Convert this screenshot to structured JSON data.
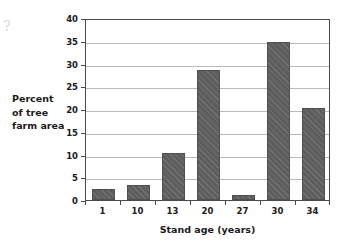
{
  "chart_data": {
    "type": "bar",
    "title": "",
    "categories": [
      "1",
      "10",
      "13",
      "20",
      "27",
      "30",
      "34"
    ],
    "values": [
      2.5,
      3.2,
      10.3,
      28.5,
      1.2,
      34.7,
      20.3
    ],
    "xlabel": "Stand age (years)",
    "ylabel": "Percent of tree farm area",
    "ylabel_lines": [
      "Percent",
      "of tree",
      "farm area"
    ],
    "ylim": [
      0,
      40
    ],
    "ytick_step": 5,
    "yticks": [
      "0",
      "5",
      "10",
      "15",
      "20",
      "25",
      "30",
      "35",
      "40"
    ],
    "grid": "horizontal",
    "legend": "none",
    "bar_color": "#5d5d5d",
    "bar_pattern": "diagonal-hatch",
    "gridline_color": "#b9b9b9",
    "axis_color": "#4a4a4a",
    "background": "#ffffff"
  },
  "artifacts": {
    "left_edge_mark": "?"
  }
}
